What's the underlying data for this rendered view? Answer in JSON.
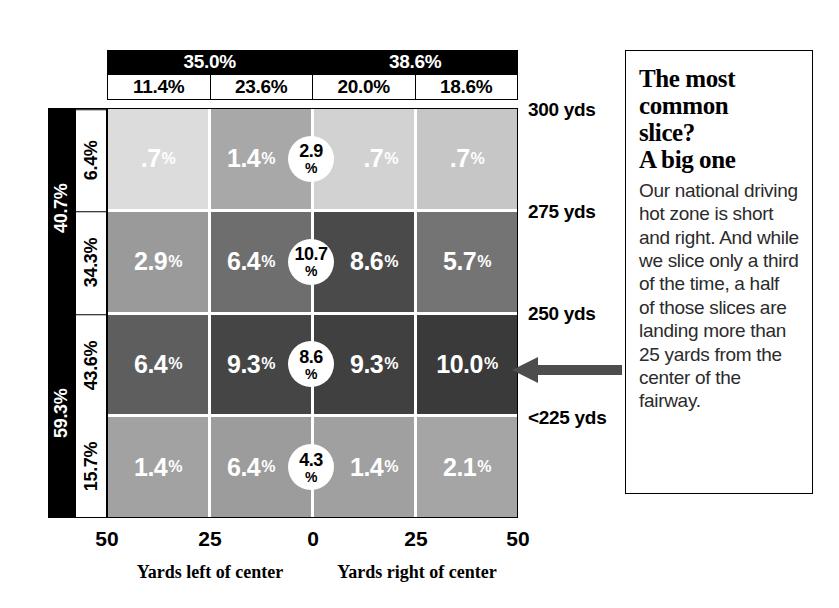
{
  "chart_data": {
    "type": "heatmap",
    "title": "The most common slice? A big one",
    "xlabel_left": "Yards left of center",
    "xlabel_right": "Yards right of center",
    "x_ticks": [
      "50",
      "25",
      "0",
      "25",
      "50"
    ],
    "column_headers": [
      "11.4%",
      "23.6%",
      "20.0%",
      "18.6%"
    ],
    "column_group_headers": [
      "35.0%",
      "38.6%"
    ],
    "row_headers": [
      "6.4%",
      "34.3%",
      "43.6%",
      "15.7%"
    ],
    "row_group_headers": [
      "40.7%",
      "59.3%"
    ],
    "row_distance_labels": [
      "300 yds",
      "275 yds",
      "250 yds",
      "<225 yds"
    ],
    "grid": [
      [
        {
          "value": ".7%",
          "num": ".7",
          "pct": "%",
          "shade": "#dcdcdc",
          "align": "center"
        },
        {
          "value": "1.4%",
          "num": "1.4",
          "pct": "%",
          "shade": "#a8a8a8",
          "align": "push-left"
        },
        {
          "value": ".7%",
          "num": ".7",
          "pct": "%",
          "shade": "#d2d2d2",
          "align": "push-right"
        },
        {
          "value": ".7%",
          "num": ".7",
          "pct": "%",
          "shade": "#c6c6c6",
          "align": "center"
        }
      ],
      [
        {
          "value": "2.9%",
          "num": "2.9",
          "pct": "%",
          "shade": "#9a9a9a",
          "align": "center"
        },
        {
          "value": "6.4%",
          "num": "6.4",
          "pct": "%",
          "shade": "#6e6e6e",
          "align": "push-left"
        },
        {
          "value": "8.6%",
          "num": "8.6",
          "pct": "%",
          "shade": "#4a4a4a",
          "align": "push-right"
        },
        {
          "value": "5.7%",
          "num": "5.7",
          "pct": "%",
          "shade": "#747474",
          "align": "center"
        }
      ],
      [
        {
          "value": "6.4%",
          "num": "6.4",
          "pct": "%",
          "shade": "#5e5e5e",
          "align": "center"
        },
        {
          "value": "9.3%",
          "num": "9.3",
          "pct": "%",
          "shade": "#454545",
          "align": "push-left"
        },
        {
          "value": "9.3%",
          "num": "9.3",
          "pct": "%",
          "shade": "#404040",
          "align": "push-right"
        },
        {
          "value": "10.0%",
          "num": "10.0",
          "pct": "%",
          "shade": "#3a3a3a",
          "align": "center"
        }
      ],
      [
        {
          "value": "1.4%",
          "num": "1.4",
          "pct": "%",
          "shade": "#a2a2a2",
          "align": "center"
        },
        {
          "value": "6.4%",
          "num": "6.4",
          "pct": "%",
          "shade": "#9c9c9c",
          "align": "push-left"
        },
        {
          "value": "1.4%",
          "num": "1.4",
          "pct": "%",
          "shade": "#a0a0a0",
          "align": "push-right"
        },
        {
          "value": "2.1%",
          "num": "2.1",
          "pct": "%",
          "shade": "#a5a5a5",
          "align": "center"
        }
      ]
    ],
    "center_circles": [
      {
        "row": 0,
        "num": "2.9",
        "pct": "%"
      },
      {
        "row": 1,
        "num": "10.7",
        "pct": "%"
      },
      {
        "row": 2,
        "num": "8.6",
        "pct": "%"
      },
      {
        "row": 3,
        "num": "4.3",
        "pct": "%"
      }
    ]
  },
  "callout": {
    "heading_line1": "The most",
    "heading_line2": "common",
    "heading_line3": "slice?",
    "heading_line4": "A big one",
    "body": "Our national driving hot zone is short and right. And while we slice only a third of the time, a half of those slices are landing more than 25 yards from the center of the fairway."
  },
  "colors": {
    "header_bar": "#000000",
    "header_text": "#ffffff",
    "arrow": "#4d4d4d",
    "border": "#000000"
  }
}
